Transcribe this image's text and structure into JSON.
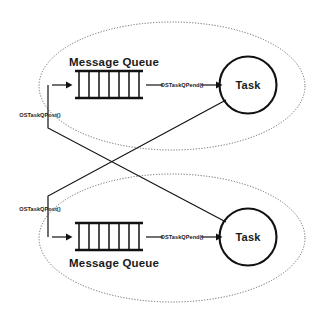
{
  "diagram": {
    "colors": {
      "background": "#ffffff",
      "stroke": "#111111",
      "dashed_group": "#4a4a4a",
      "text": "#1a1a1a"
    },
    "groups": [
      {
        "id": "top-group",
        "queue_label": "Message Queue",
        "queue_label_position": "above",
        "queue_cells": 7,
        "task_label": "Task",
        "pend_call": "OSTaskQPend()",
        "post_call": "OSTaskQPost()"
      },
      {
        "id": "bottom-group",
        "queue_label": "Message Queue",
        "queue_label_position": "below",
        "queue_cells": 7,
        "task_label": "Task",
        "pend_call": "OSTaskQPend()",
        "post_call": "OSTaskQPost()"
      }
    ]
  }
}
